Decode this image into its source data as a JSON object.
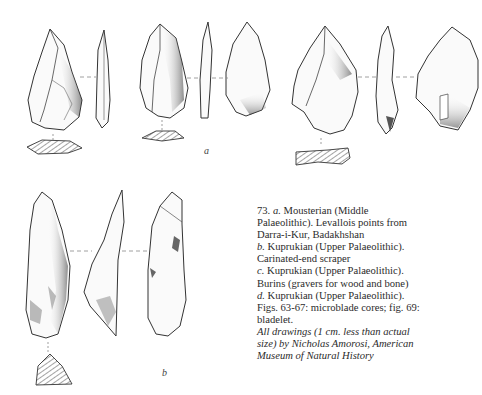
{
  "figure": {
    "number": "73.",
    "labels": {
      "a": "a",
      "b": "b"
    },
    "caption_lines": [
      {
        "lead": "73. ",
        "letter": "a.",
        "text": " Mousterian (Middle"
      },
      {
        "lead": "",
        "letter": "",
        "text": "Palaeolithic). Levallois points from"
      },
      {
        "lead": "",
        "letter": "",
        "text": "Darra-i-Kur, Badakhshan"
      },
      {
        "lead": "",
        "letter": "b.",
        "text": " Kuprukian (Upper Palaeolithic)."
      },
      {
        "lead": "",
        "letter": "",
        "text": "Carinated-end scraper"
      },
      {
        "lead": "",
        "letter": "c.",
        "text": " Kuprukian (Upper Palaeolithic)."
      },
      {
        "lead": "",
        "letter": "",
        "text": "Burins (gravers for wood and bone)"
      },
      {
        "lead": "",
        "letter": "d.",
        "text": " Kuprukian (Upper Palaeolithic)."
      },
      {
        "lead": "",
        "letter": "",
        "text": "Figs. 63-67: microblade cores; fig. 69:"
      },
      {
        "lead": "",
        "letter": "",
        "text": "bladelet."
      }
    ],
    "credit_lines": [
      "All drawings (1 cm. less than actual",
      "size) by Nicholas Amorosi, American",
      "Museum of Natural History"
    ],
    "artifacts": [
      {
        "group": "a",
        "description": "Levallois point 1 (front, side, section)"
      },
      {
        "group": "a",
        "description": "Levallois point 2 (front, side, back, section)"
      },
      {
        "group": "a",
        "description": "Levallois point 3 (front, side, back, section)"
      },
      {
        "group": "b",
        "description": "Carinated-end scraper (front, side, back, section)"
      }
    ]
  }
}
